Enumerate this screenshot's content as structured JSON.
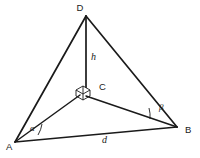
{
  "figure": {
    "background_color": "#ffffff",
    "stroke_color": "#1a1a1a",
    "type": "geometric-line-diagram"
  },
  "vertices": {
    "D": {
      "label": "D",
      "x": 86,
      "y": 16,
      "label_x": 80,
      "label_y": 11
    },
    "C": {
      "label": "C",
      "x": 83,
      "y": 92,
      "label_x": 99,
      "label_y": 90
    },
    "A": {
      "label": "A",
      "x": 15,
      "y": 142,
      "label_x": 6,
      "label_y": 150
    },
    "B": {
      "label": "B",
      "x": 177,
      "y": 127,
      "label_x": 185,
      "label_y": 133
    }
  },
  "segments": {
    "height": {
      "label": "h",
      "from": "D",
      "to": "C",
      "label_x": 91,
      "label_y": 60
    },
    "base": {
      "label": "d",
      "from": "A",
      "to": "B",
      "label_x": 102,
      "label_y": 143
    }
  },
  "angles": {
    "alpha": {
      "label": "α",
      "at_vertex": "A",
      "label_x": 30,
      "label_y": 131
    },
    "beta": {
      "label": "β",
      "at_vertex": "B",
      "label_x": 159,
      "label_y": 110
    }
  },
  "markers": {
    "right_angle": {
      "name": "right-angle-cube",
      "at_vertex": "C"
    }
  }
}
